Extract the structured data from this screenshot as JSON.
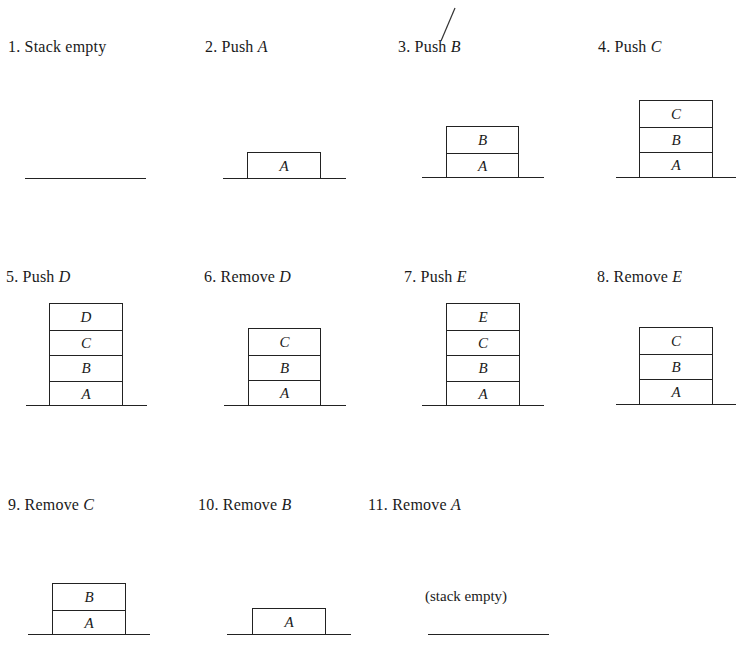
{
  "figure": {
    "steps": [
      {
        "num": "1.",
        "action": "Stack empty",
        "item": "",
        "stack": []
      },
      {
        "num": "2.",
        "action": "Push",
        "item": "A",
        "stack": [
          "A"
        ]
      },
      {
        "num": "3.",
        "action": "Push",
        "item": "B",
        "stack": [
          "B",
          "A"
        ]
      },
      {
        "num": "4.",
        "action": "Push",
        "item": "C",
        "stack": [
          "C",
          "B",
          "A"
        ]
      },
      {
        "num": "5.",
        "action": "Push",
        "item": "D",
        "stack": [
          "D",
          "C",
          "B",
          "A"
        ]
      },
      {
        "num": "6.",
        "action": "Remove",
        "item": "D",
        "stack": [
          "C",
          "B",
          "A"
        ]
      },
      {
        "num": "7.",
        "action": "Push",
        "item": "E",
        "stack": [
          "E",
          "C",
          "B",
          "A"
        ]
      },
      {
        "num": "8.",
        "action": "Remove",
        "item": "E",
        "stack": [
          "C",
          "B",
          "A"
        ]
      },
      {
        "num": "9.",
        "action": "Remove",
        "item": "C",
        "stack": [
          "B",
          "A"
        ]
      },
      {
        "num": "10.",
        "action": "Remove",
        "item": "B",
        "stack": [
          "A"
        ]
      },
      {
        "num": "11.",
        "action": "Remove",
        "item": "A",
        "stack": [],
        "note": "(stack empty)"
      }
    ]
  }
}
